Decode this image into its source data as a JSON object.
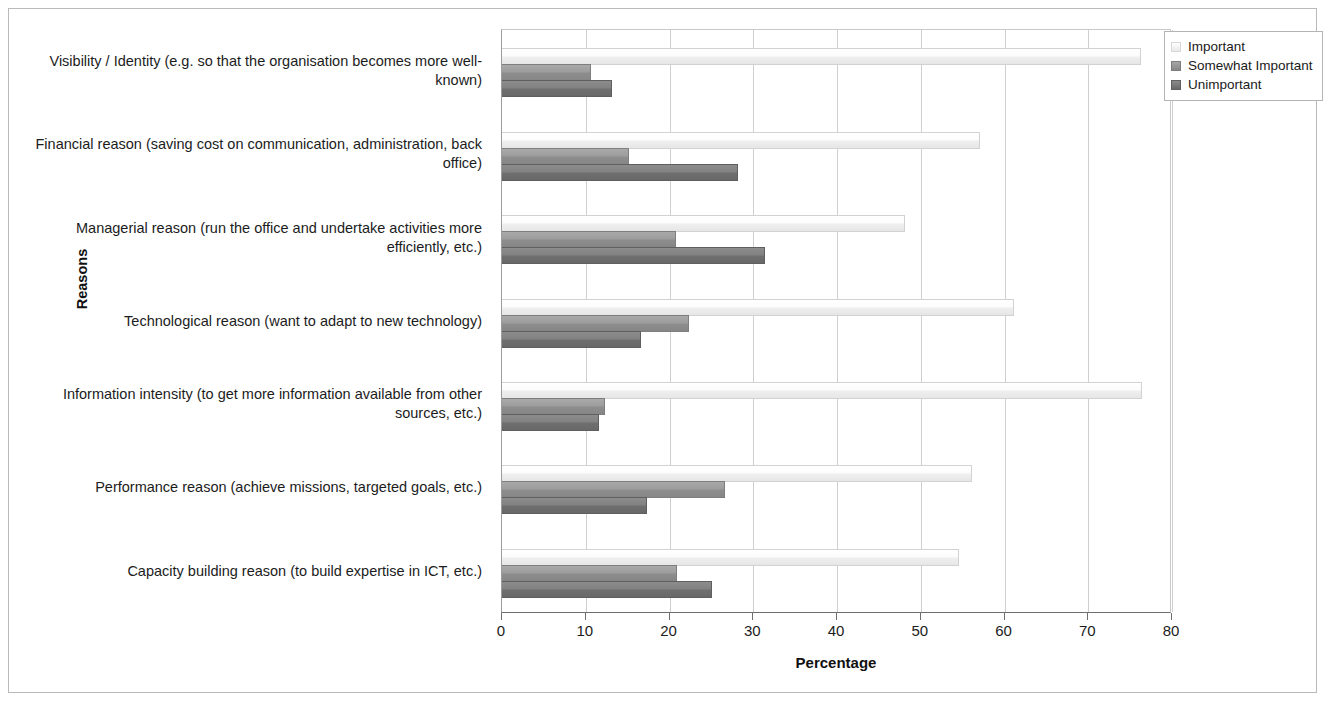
{
  "chart_data": {
    "type": "bar",
    "orientation": "horizontal",
    "title": "",
    "xlabel": "Percentage",
    "ylabel": "Reasons",
    "xlim": [
      0,
      80
    ],
    "xticks": [
      0,
      10,
      20,
      30,
      40,
      50,
      60,
      70,
      80
    ],
    "grid": true,
    "legend_position": "top-right",
    "categories": [
      "Visibility / Identity (e.g. so that the organisation becomes more well-known)",
      "Financial reason (saving cost on communication, administration, back office)",
      "Managerial reason (run the office and undertake activities more efficiently, etc.)",
      "Technological reason (want to adapt to new technology)",
      "Information intensity (to get more information available from other sources, etc.)",
      "Performance reason (achieve missions, targeted goals, etc.)",
      "Capacity building reason (to build expertise in ICT, etc.)"
    ],
    "series": [
      {
        "name": "Important",
        "color": "#efefef",
        "values": [
          76.2,
          57.0,
          48.0,
          61.0,
          76.3,
          56.0,
          54.5
        ]
      },
      {
        "name": "Somewhat Important",
        "color": "#909090",
        "values": [
          10.5,
          15.0,
          20.7,
          22.2,
          12.2,
          26.5,
          20.8
        ]
      },
      {
        "name": "Unimportant",
        "color": "#727272",
        "values": [
          13.0,
          28.0,
          31.3,
          16.5,
          11.5,
          17.2,
          25.0
        ]
      }
    ]
  },
  "axis": {
    "x_title": "Percentage",
    "y_title": "Reasons",
    "x_tick_labels": [
      "0",
      "10",
      "20",
      "30",
      "40",
      "50",
      "60",
      "70",
      "80"
    ]
  },
  "legend": {
    "items": [
      {
        "label": "Important"
      },
      {
        "label": "Somewhat Important"
      },
      {
        "label": "Unimportant"
      }
    ]
  }
}
